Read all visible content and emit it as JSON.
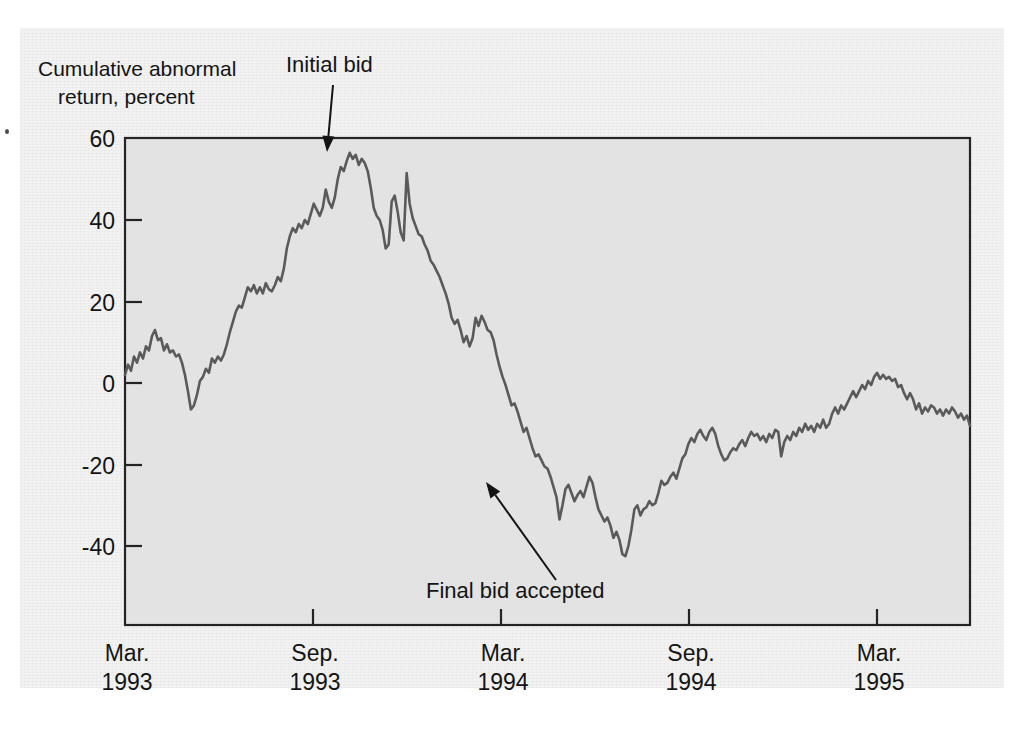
{
  "chart_data": {
    "type": "line",
    "title": "",
    "ylabel_line1": "Cumulative abnormal",
    "ylabel_line2": "return, percent",
    "xlabel": "",
    "ylim": [
      -55,
      60
    ],
    "xlim": [
      0,
      27
    ],
    "grid": false,
    "legend": "none",
    "yticks": [
      60,
      40,
      20,
      0,
      -20,
      -40
    ],
    "ytick_labels": [
      "60",
      "40",
      "20",
      "0",
      "-20",
      "-40"
    ],
    "xticks": [
      0,
      6,
      12,
      18,
      24
    ],
    "xtick_labels": [
      {
        "month": "Mar.",
        "year": "1993"
      },
      {
        "month": "Sep.",
        "year": "1993"
      },
      {
        "month": "Mar.",
        "year": "1994"
      },
      {
        "month": "Sep.",
        "year": "1994"
      },
      {
        "month": "Mar.",
        "year": "1995"
      }
    ],
    "xtick_minor": [
      3,
      9,
      15,
      21
    ],
    "series_name": "Cumulative abnormal return",
    "series_color": "#5a5a5a",
    "x_unit": "months since Mar. 1993",
    "values": [
      2.0,
      4.5,
      3.0,
      6.5,
      5.0,
      7.5,
      6.0,
      9.0,
      8.0,
      11.5,
      13.0,
      10.5,
      11.0,
      8.0,
      9.5,
      7.5,
      8.0,
      6.5,
      7.0,
      5.0,
      2.0,
      -2.0,
      -6.5,
      -5.5,
      -3.0,
      0.5,
      1.5,
      3.5,
      2.5,
      6.0,
      5.0,
      6.5,
      5.5,
      7.0,
      9.5,
      12.5,
      15.0,
      17.5,
      19.0,
      18.5,
      21.0,
      23.5,
      22.5,
      24.0,
      22.0,
      23.5,
      22.0,
      24.5,
      23.0,
      22.5,
      24.0,
      26.0,
      25.0,
      28.0,
      33.0,
      36.0,
      38.0,
      37.0,
      39.0,
      38.0,
      40.0,
      39.0,
      41.5,
      44.0,
      42.5,
      41.0,
      43.0,
      47.5,
      44.5,
      43.0,
      45.5,
      50.0,
      53.0,
      52.0,
      54.5,
      56.5,
      55.0,
      56.0,
      53.5,
      55.0,
      54.0,
      52.0,
      48.0,
      43.0,
      41.0,
      40.0,
      37.5,
      33.0,
      34.0,
      44.5,
      46.0,
      42.0,
      37.0,
      35.0,
      51.5,
      44.0,
      40.5,
      38.5,
      36.5,
      36.0,
      34.0,
      32.5,
      30.0,
      29.0,
      27.5,
      26.0,
      24.0,
      22.0,
      19.5,
      16.0,
      14.5,
      15.5,
      13.0,
      10.0,
      11.5,
      9.0,
      11.0,
      16.0,
      14.0,
      16.5,
      15.0,
      13.0,
      12.5,
      10.5,
      7.0,
      4.0,
      1.5,
      -0.5,
      -3.0,
      -5.5,
      -5.0,
      -7.0,
      -9.5,
      -12.0,
      -11.0,
      -13.5,
      -16.0,
      -18.0,
      -17.5,
      -19.0,
      -20.5,
      -21.0,
      -23.0,
      -25.5,
      -28.0,
      -33.5,
      -30.0,
      -26.0,
      -25.0,
      -27.0,
      -29.0,
      -27.5,
      -26.5,
      -28.0,
      -25.5,
      -23.0,
      -24.5,
      -28.0,
      -31.0,
      -32.5,
      -34.0,
      -33.0,
      -35.0,
      -38.0,
      -36.5,
      -38.5,
      -42.0,
      -42.5,
      -40.0,
      -36.0,
      -31.0,
      -30.0,
      -32.5,
      -31.0,
      -30.5,
      -29.0,
      -30.0,
      -29.5,
      -27.0,
      -24.0,
      -25.0,
      -24.5,
      -23.0,
      -22.0,
      -23.5,
      -21.0,
      -18.5,
      -17.5,
      -15.0,
      -13.5,
      -14.5,
      -12.5,
      -11.5,
      -13.0,
      -14.0,
      -12.0,
      -11.0,
      -12.5,
      -15.5,
      -17.5,
      -19.0,
      -18.5,
      -17.0,
      -16.0,
      -16.5,
      -15.0,
      -14.0,
      -15.5,
      -13.5,
      -12.0,
      -13.0,
      -12.5,
      -14.0,
      -13.0,
      -14.5,
      -12.5,
      -13.5,
      -11.5,
      -12.0,
      -18.0,
      -14.5,
      -13.0,
      -14.0,
      -12.0,
      -13.0,
      -11.0,
      -12.0,
      -10.0,
      -11.5,
      -10.5,
      -12.0,
      -10.0,
      -11.0,
      -9.0,
      -11.0,
      -10.0,
      -7.5,
      -6.0,
      -7.5,
      -5.5,
      -6.5,
      -5.0,
      -3.5,
      -2.0,
      -3.5,
      -2.0,
      -0.5,
      -1.5,
      0.5,
      -0.5,
      1.5,
      2.5,
      1.0,
      2.0,
      1.0,
      1.5,
      0.5,
      1.0,
      -1.0,
      -0.5,
      -2.5,
      -4.0,
      -2.5,
      -4.0,
      -6.5,
      -5.0,
      -7.5,
      -6.0,
      -7.0,
      -5.5,
      -6.0,
      -7.5,
      -6.5,
      -8.0,
      -6.5,
      -7.5,
      -6.0,
      -7.0,
      -8.5,
      -7.5,
      -9.0,
      -8.0,
      -10.5
    ],
    "annotations": [
      {
        "id": "initial-bid",
        "label": "Initial bid",
        "text_x": 286,
        "text_y": 72,
        "arrow_from_x": 333,
        "arrow_from_y": 85,
        "arrow_to_x": 327,
        "arrow_to_y": 152,
        "points_to_value": 56,
        "points_to_date": "Sep. 1993"
      },
      {
        "id": "final-bid-accepted",
        "label": "Final bid accepted",
        "text_x": 426,
        "text_y": 598,
        "arrow_from_x": 556,
        "arrow_from_y": 580,
        "arrow_to_x": 486,
        "arrow_to_y": 482,
        "points_to_value": -25,
        "points_to_date": "Mar. 1994"
      }
    ],
    "colors": {
      "page_background": "#f2f2f2",
      "panel_background": "#e3e3e3",
      "line": "#5a5a5a",
      "axis": "#242424",
      "text": "#141414"
    }
  }
}
